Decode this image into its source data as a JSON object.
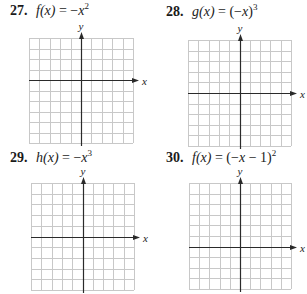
{
  "problems": [
    {
      "number": "27.",
      "func": "f(x)",
      "equals": "=",
      "rhs_prefix": "−",
      "rhs_base": "x",
      "rhs_suffix": "",
      "exponent": "2",
      "expression_text": "f(x) = −x²",
      "grid": {
        "columns": 10,
        "rows": 10,
        "y_axis_col": 5,
        "x_axis_row": 4,
        "x_label": "x",
        "y_label": "y"
      }
    },
    {
      "number": "28.",
      "func": "g(x)",
      "equals": "=",
      "rhs_prefix": "(−",
      "rhs_base": "x",
      "rhs_suffix": ")",
      "exponent": "3",
      "expression_text": "g(x) = (−x)³",
      "grid": {
        "columns": 10,
        "rows": 10,
        "y_axis_col": 5,
        "x_axis_row": 5,
        "x_label": "x",
        "y_label": "y"
      }
    },
    {
      "number": "29.",
      "func": "h(x)",
      "equals": "=",
      "rhs_prefix": "−",
      "rhs_base": "x",
      "rhs_suffix": "",
      "exponent": "3",
      "expression_text": "h(x) = −x³",
      "grid": {
        "columns": 10,
        "rows": 10,
        "y_axis_col": 5,
        "x_axis_row": 5,
        "x_label": "x",
        "y_label": "y"
      }
    },
    {
      "number": "30.",
      "func": "f(x)",
      "equals": "=",
      "rhs_prefix": "(−",
      "rhs_base": "x",
      "rhs_suffix": " − 1)",
      "exponent": "2",
      "expression_text": "f(x) = (−x − 1)²",
      "grid": {
        "columns": 10,
        "rows": 10,
        "y_axis_col": 5,
        "x_axis_row": 6,
        "x_label": "x",
        "y_label": "y"
      }
    }
  ],
  "colors": {
    "grid_line": "#c8c8c8",
    "axis": "#2a2a2a",
    "text": "#1a1a1a"
  }
}
